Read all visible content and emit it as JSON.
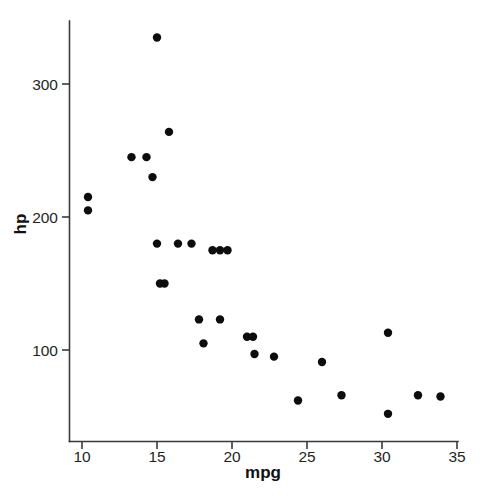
{
  "chart_data": {
    "type": "scatter",
    "title": "",
    "xlabel": "mpg",
    "ylabel": "hp",
    "xlim": [
      9.0,
      35.0
    ],
    "ylim": [
      35,
      350
    ],
    "grid": false,
    "legend": null,
    "x_ticks": [
      10,
      15,
      20,
      25,
      30,
      35
    ],
    "x_tick_labels": [
      "10",
      "15",
      "20",
      "25",
      "30",
      "35"
    ],
    "y_ticks": [
      100,
      200,
      300
    ],
    "y_tick_labels": [
      "100",
      "200",
      "300"
    ],
    "marker": {
      "shape": "circle",
      "color": "#0d0d0d",
      "radius_px": 4.2
    },
    "points": [
      {
        "x": 10.4,
        "y": 205
      },
      {
        "x": 10.4,
        "y": 215
      },
      {
        "x": 13.3,
        "y": 245
      },
      {
        "x": 14.3,
        "y": 245
      },
      {
        "x": 14.7,
        "y": 230
      },
      {
        "x": 15.0,
        "y": 335
      },
      {
        "x": 15.2,
        "y": 150
      },
      {
        "x": 15.5,
        "y": 150
      },
      {
        "x": 15.8,
        "y": 264
      },
      {
        "x": 15.0,
        "y": 180
      },
      {
        "x": 16.4,
        "y": 180
      },
      {
        "x": 17.3,
        "y": 180
      },
      {
        "x": 17.8,
        "y": 123
      },
      {
        "x": 18.1,
        "y": 105
      },
      {
        "x": 18.7,
        "y": 175
      },
      {
        "x": 19.2,
        "y": 175
      },
      {
        "x": 19.7,
        "y": 175
      },
      {
        "x": 19.2,
        "y": 123
      },
      {
        "x": 21.0,
        "y": 110
      },
      {
        "x": 21.4,
        "y": 110
      },
      {
        "x": 21.5,
        "y": 97
      },
      {
        "x": 22.8,
        "y": 95
      },
      {
        "x": 24.4,
        "y": 62
      },
      {
        "x": 26.0,
        "y": 91
      },
      {
        "x": 27.3,
        "y": 66
      },
      {
        "x": 30.4,
        "y": 113
      },
      {
        "x": 30.4,
        "y": 52
      },
      {
        "x": 32.4,
        "y": 66
      },
      {
        "x": 33.9,
        "y": 65
      }
    ]
  },
  "axes": {
    "x_title": "mpg",
    "y_title": "hp"
  },
  "page": {
    "background": "#ffffff",
    "ink": "#0d0d0d",
    "faint_caption": ""
  }
}
